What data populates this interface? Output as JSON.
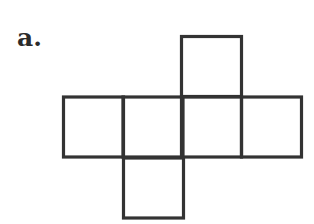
{
  "figure": {
    "label": "a.",
    "stroke_color": "#333333",
    "stroke_width": 3.2,
    "squares": [
      {
        "name": "top",
        "x": 181.5,
        "y": 36.5,
        "size": 60
      },
      {
        "name": "left",
        "x": 63.5,
        "y": 97,
        "size": 60
      },
      {
        "name": "center-left",
        "x": 123,
        "y": 97,
        "size": 60
      },
      {
        "name": "center-right",
        "x": 181.5,
        "y": 97,
        "size": 60
      },
      {
        "name": "right",
        "x": 241.5,
        "y": 97,
        "size": 60
      },
      {
        "name": "bottom",
        "x": 123.5,
        "y": 158,
        "size": 60
      }
    ]
  }
}
